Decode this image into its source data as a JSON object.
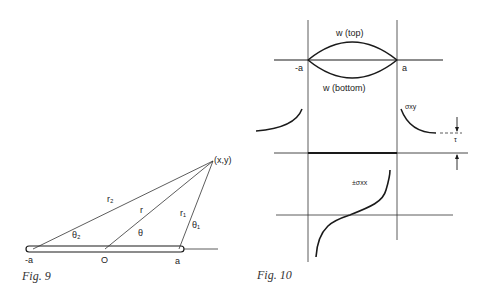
{
  "figures": [
    {
      "caption": "Fig. 9",
      "labels": {
        "point": "(x,y)",
        "r2": "r₂",
        "r": "r",
        "r1": "r₁",
        "theta2": "θ₂",
        "theta": "θ",
        "theta1": "θ₁",
        "neg_a": "-a",
        "origin": "O",
        "a": "a"
      }
    },
    {
      "caption": "Fig. 10",
      "labels": {
        "w_top": "w (top)",
        "w_bottom": "w (bottom)",
        "neg_a": "-a",
        "a": "a",
        "sigma_xy": "σxy",
        "tau": "τ",
        "sigma_xx": "±σxx"
      }
    }
  ],
  "colors": {
    "ink": "#1a1a1a",
    "thin_line": "#333333",
    "background": "#ffffff"
  }
}
